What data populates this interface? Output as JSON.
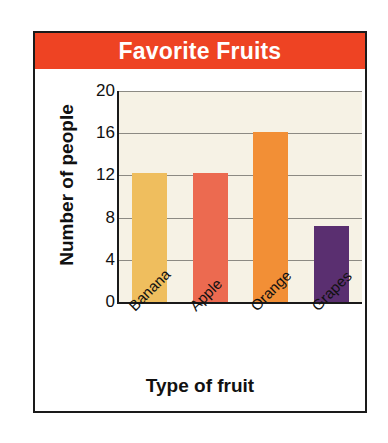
{
  "chart_data": {
    "type": "bar",
    "title": "Favorite Fruits",
    "xlabel": "Type of fruit",
    "ylabel": "Number of people",
    "categories": [
      "Banana",
      "Apple",
      "Orange",
      "Grapes"
    ],
    "values": [
      12.2,
      12.2,
      16.1,
      7.2
    ],
    "bar_colors": [
      "#efbe5e",
      "#ec6a50",
      "#f28f36",
      "#5a2f70"
    ],
    "ylim": [
      0,
      20
    ],
    "yticks": [
      0,
      4,
      8,
      12,
      16,
      20
    ],
    "ytick_labels": [
      "0",
      "4",
      "8",
      "12",
      "16",
      "20"
    ],
    "grid": true,
    "grid_axis": "y",
    "legend": false,
    "xtick_rotation": -45,
    "plot_background": "#f6f2e5",
    "title_background": "#ee4323",
    "title_color": "#ffffff",
    "gridline_color": "#8c8a83",
    "axis_color": "#1a1a1a"
  }
}
